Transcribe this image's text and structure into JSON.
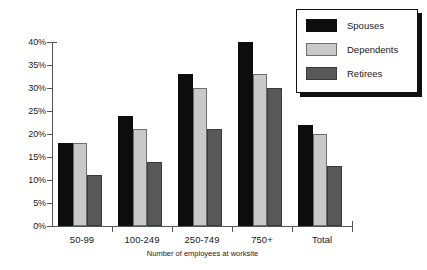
{
  "chart_data": {
    "type": "bar",
    "title": "",
    "xlabel": "Number of employees at worksite",
    "ylabel": "",
    "categories": [
      "50-99",
      "100-249",
      "250-749",
      "750+",
      "Total"
    ],
    "series": [
      {
        "name": "Spouses",
        "color": "#0d0d0d",
        "values": [
          18,
          24,
          33,
          40,
          22
        ]
      },
      {
        "name": "Dependents",
        "color": "#c9c9c9",
        "values": [
          18,
          21,
          30,
          33,
          20
        ]
      },
      {
        "name": "Retirees",
        "color": "#585858",
        "values": [
          11,
          14,
          21,
          30,
          13
        ]
      }
    ],
    "ylim": [
      0,
      40
    ],
    "ytick_values": [
      0,
      5,
      10,
      15,
      20,
      25,
      30,
      35,
      40
    ],
    "ytick_labels": [
      "0%",
      "5%",
      "10%",
      "15%",
      "20%",
      "25%",
      "30%",
      "35%",
      "40%"
    ],
    "grid": false,
    "legend_position": "top-right",
    "legend_entries": [
      "Spouses",
      "Dependents",
      "Retirees"
    ]
  }
}
